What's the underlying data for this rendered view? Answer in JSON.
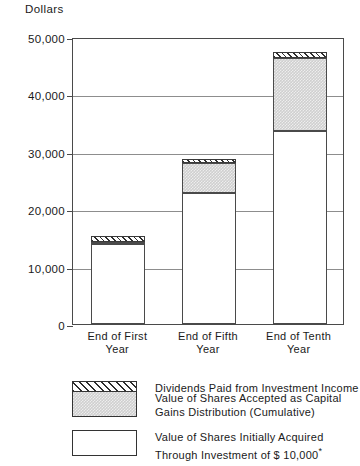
{
  "chart_data": {
    "type": "bar",
    "stacked": true,
    "title": "",
    "xlabel": "",
    "ylabel": "Dollars",
    "ylim": [
      0,
      50000
    ],
    "yticks": [
      0,
      10000,
      20000,
      30000,
      40000,
      50000
    ],
    "ytick_labels": [
      "0",
      "10,000",
      "20,000",
      "30,000",
      "40,000",
      "50,000"
    ],
    "grid": true,
    "legend_position": "below",
    "categories": [
      "End of First Year",
      "End of Fifth Year",
      "End of Tenth Year"
    ],
    "category_lines": [
      [
        "End of First",
        "Year"
      ],
      [
        "End of Fifth",
        "Year"
      ],
      [
        "End of Tenth",
        "Year"
      ]
    ],
    "series": [
      {
        "name": "Value of Shares Initially Acquired Through Investment of $ 10,000",
        "key": "initial_shares",
        "fill": "white",
        "values": [
          13900,
          22800,
          33600
        ]
      },
      {
        "name": "Value of Shares Accepted as Capital Gains Distribution (Cumulative)",
        "key": "capital_gains",
        "fill": "gray-stipple",
        "values": [
          400,
          5300,
          12700
        ]
      },
      {
        "name": "Dividends Paid from Investment Income",
        "key": "dividends",
        "fill": "diagonal-hatch",
        "values": [
          1100,
          700,
          1100
        ]
      }
    ],
    "totals": [
      15000,
      28800,
      47400
    ]
  },
  "axis": {
    "y_title": "Dollars"
  },
  "legend": {
    "items": [
      {
        "swatch": "diagonal-hatch",
        "line1": "Dividends Paid from Investment Income",
        "line2": ""
      },
      {
        "swatch": "gray-stipple",
        "line1": "Value of Shares Accepted as Capital",
        "line2": "Gains Distribution (Cumulative)"
      },
      {
        "swatch": "white",
        "line1": "Value of Shares Initially Acquired",
        "line2": "Through Investment of $ 10,000"
      }
    ],
    "asterisk": "*"
  },
  "colors": {
    "frame": "#4a4a4a",
    "grid": "#8d8d8d",
    "hatch": "#2e2e2e",
    "stipple": "#cfcfcf",
    "text": "#1a1a1a"
  }
}
